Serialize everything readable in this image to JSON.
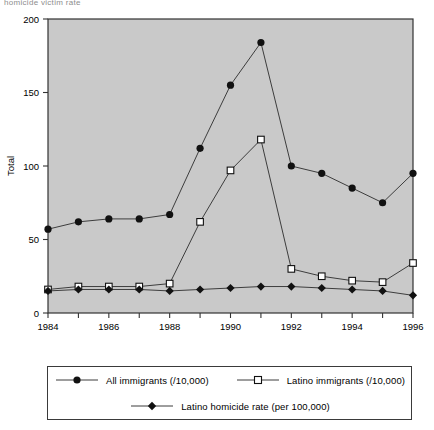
{
  "figure": {
    "cropped_header_text": "homicide victim rate",
    "plot_bg_color": "#c9c9c9",
    "frame_color": "#333333",
    "line_color": "#3d3d3d"
  },
  "chart_data": {
    "type": "line",
    "title": "",
    "xlabel": "Year",
    "ylabel": "Total",
    "x": [
      1984,
      1985,
      1986,
      1987,
      1988,
      1989,
      1990,
      1991,
      1992,
      1993,
      1994,
      1995,
      1996
    ],
    "xlim": [
      1984,
      1996
    ],
    "ylim": [
      0,
      200
    ],
    "yticks": [
      0,
      50,
      100,
      150,
      200
    ],
    "xticks_labeled": [
      1984,
      1986,
      1988,
      1990,
      1992,
      1994,
      1996
    ],
    "xticks_minor_every": 1,
    "grid": false,
    "legend_position": "below-plot",
    "series": [
      {
        "name": "All immigrants (/10,000)",
        "marker": "filled-circle",
        "values": [
          57,
          62,
          64,
          64,
          67,
          112,
          155,
          184,
          100,
          95,
          85,
          75,
          95
        ]
      },
      {
        "name": "Latino immigrants (/10,000)",
        "marker": "open-square",
        "values": [
          16,
          18,
          18,
          18,
          20,
          62,
          97,
          118,
          30,
          25,
          22,
          21,
          34
        ]
      },
      {
        "name": "Latino homicide rate (per 100,000)",
        "marker": "filled-diamond",
        "values": [
          15,
          16,
          16,
          16,
          15,
          16,
          17,
          18,
          18,
          17,
          16,
          15,
          12
        ]
      }
    ]
  },
  "axis": {
    "y_label": "Total",
    "x_label": "Year",
    "y_tick_labels": [
      "0",
      "50",
      "100",
      "150",
      "200"
    ],
    "x_tick_labels": [
      "1984",
      "1986",
      "1988",
      "1990",
      "1992",
      "1994",
      "1996"
    ]
  },
  "legend": {
    "items": [
      {
        "label": "All immigrants (/10,000)",
        "marker": "filled-circle"
      },
      {
        "label": "Latino immigrants (/10,000)",
        "marker": "open-square"
      },
      {
        "label": "Latino homicide rate (per 100,000)",
        "marker": "filled-diamond"
      }
    ]
  }
}
